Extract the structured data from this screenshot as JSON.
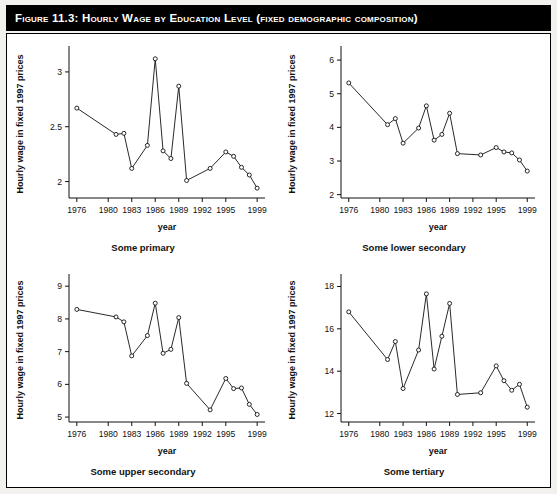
{
  "figure": {
    "title": "Figure 11.3: Hourly Wage by Education Level (fixed demographic composition)",
    "title_banner_color": "#000000",
    "title_text_color": "#ffffff",
    "page_background": "#f2f1ee",
    "plot_background": "#ffffff",
    "ink_color": "#111111"
  },
  "chart_data": [
    {
      "type": "line",
      "panel": "top-left",
      "title": "Some primary",
      "xlabel": "year",
      "ylabel": "Hourly wage in fixed 1997 prices",
      "grid": false,
      "legend": false,
      "marker": "open-circle",
      "xlim": [
        1975,
        2000
      ],
      "ylim": [
        1.85,
        3.2
      ],
      "xticks": [
        1976,
        1980,
        1983,
        1986,
        1989,
        1992,
        1995,
        1999
      ],
      "xticklabels": [
        "1976",
        "1980",
        "1983",
        "1986",
        "1989",
        "1992",
        "1995",
        "1999"
      ],
      "yticks": [
        2,
        2.5,
        3
      ],
      "yticklabels": [
        "2",
        "2.5",
        "3"
      ],
      "x": [
        1976,
        1981,
        1982,
        1983,
        1985,
        1986,
        1987,
        1988,
        1989,
        1990,
        1993,
        1995,
        1996,
        1997,
        1998,
        1999
      ],
      "values": [
        2.67,
        2.43,
        2.44,
        2.12,
        2.33,
        3.12,
        2.28,
        2.21,
        2.87,
        2.01,
        2.12,
        2.27,
        2.23,
        2.13,
        2.06,
        1.94
      ]
    },
    {
      "type": "line",
      "panel": "top-right",
      "title": "Some lower secondary",
      "xlabel": "year",
      "ylabel": "Hourly wage in fixed 1997 prices",
      "grid": false,
      "legend": false,
      "marker": "open-circle",
      "xlim": [
        1975,
        2000
      ],
      "ylim": [
        1.9,
        6.3
      ],
      "xticks": [
        1976,
        1980,
        1983,
        1986,
        1989,
        1992,
        1995,
        1999
      ],
      "xticklabels": [
        "1976",
        "1980",
        "1983",
        "1986",
        "1989",
        "1992",
        "1995",
        "1999"
      ],
      "yticks": [
        2,
        3,
        4,
        5,
        6
      ],
      "yticklabels": [
        "2",
        "3",
        "4",
        "5",
        "6"
      ],
      "x": [
        1976,
        1981,
        1982,
        1983,
        1985,
        1986,
        1987,
        1988,
        1989,
        1990,
        1993,
        1995,
        1996,
        1997,
        1998,
        1999
      ],
      "values": [
        5.32,
        4.08,
        4.26,
        3.53,
        3.98,
        4.64,
        3.62,
        3.79,
        4.42,
        3.22,
        3.18,
        3.4,
        3.27,
        3.24,
        3.03,
        2.7
      ]
    },
    {
      "type": "line",
      "panel": "bottom-left",
      "title": "Some upper secondary",
      "xlabel": "year",
      "ylabel": "Hourly wage in fixed 1997 prices",
      "grid": false,
      "legend": false,
      "marker": "open-circle",
      "xlim": [
        1975,
        2000
      ],
      "ylim": [
        4.85,
        9.25
      ],
      "xticks": [
        1976,
        1980,
        1983,
        1986,
        1989,
        1992,
        1995,
        1999
      ],
      "xticklabels": [
        "1976",
        "1980",
        "1983",
        "1986",
        "1989",
        "1992",
        "1995",
        "1999"
      ],
      "yticks": [
        5,
        6,
        7,
        8,
        9
      ],
      "yticklabels": [
        "5",
        "6",
        "7",
        "8",
        "9"
      ],
      "x": [
        1976,
        1981,
        1982,
        1983,
        1985,
        1986,
        1987,
        1988,
        1989,
        1990,
        1993,
        1995,
        1996,
        1997,
        1998,
        1999
      ],
      "values": [
        8.29,
        8.06,
        7.91,
        6.87,
        7.49,
        8.48,
        6.95,
        7.07,
        8.04,
        6.03,
        5.22,
        6.18,
        5.87,
        5.89,
        5.39,
        5.08
      ]
    },
    {
      "type": "line",
      "panel": "bottom-right",
      "title": "Some tertiary",
      "xlabel": "year",
      "ylabel": "Hourly wage in fixed 1997 prices",
      "grid": false,
      "legend": false,
      "marker": "open-circle",
      "xlim": [
        1975,
        2000
      ],
      "ylim": [
        11.6,
        18.4
      ],
      "xticks": [
        1976,
        1980,
        1983,
        1986,
        1989,
        1992,
        1995,
        1999
      ],
      "xticklabels": [
        "1976",
        "1980",
        "1983",
        "1986",
        "1989",
        "1992",
        "1995",
        "1999"
      ],
      "yticks": [
        12,
        14,
        16,
        18
      ],
      "yticklabels": [
        "12",
        "14",
        "16",
        "18"
      ],
      "x": [
        1976,
        1981,
        1982,
        1983,
        1985,
        1986,
        1987,
        1988,
        1989,
        1990,
        1993,
        1995,
        1996,
        1997,
        1998,
        1999
      ],
      "values": [
        16.8,
        14.55,
        15.4,
        13.18,
        15.0,
        17.65,
        14.1,
        15.65,
        17.2,
        12.9,
        12.98,
        14.25,
        13.55,
        13.1,
        13.38,
        12.3
      ]
    }
  ]
}
